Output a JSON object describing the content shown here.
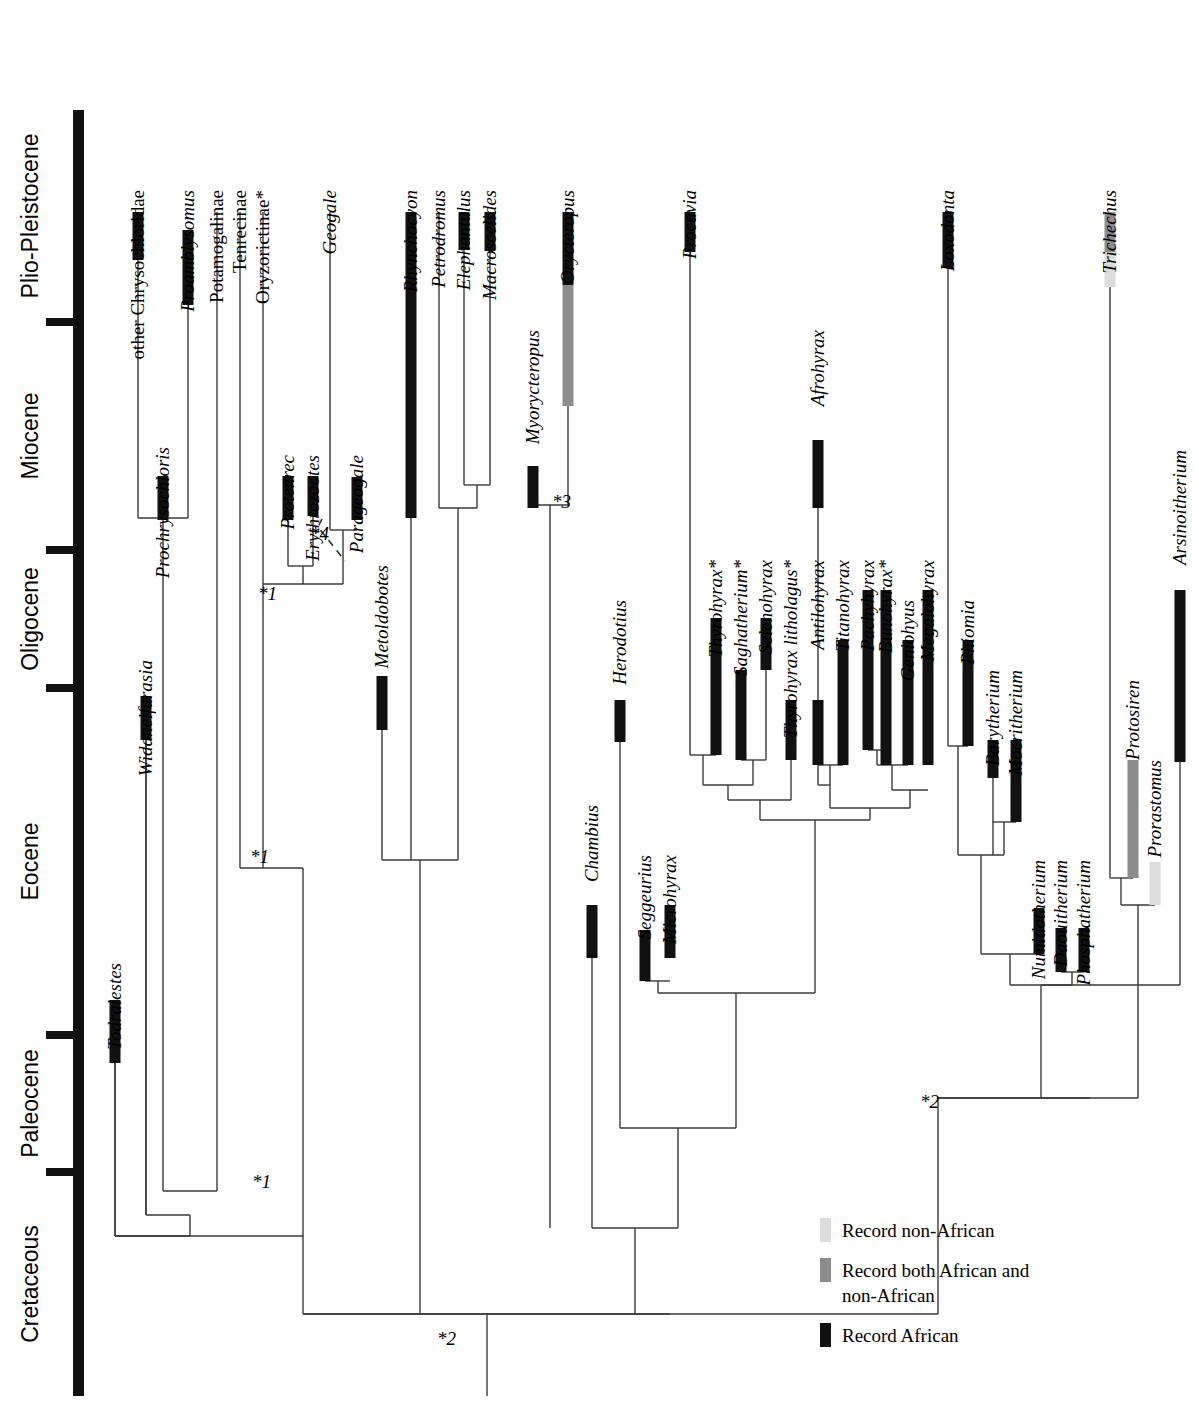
{
  "figure": {
    "type": "phylogenetic-time-tree",
    "orientation": "vertical-time-left",
    "colors": {
      "record_african": "#111111",
      "record_both": "#8c8c8c",
      "record_non_african": "#dcdcdc",
      "branch": "#3a3a3a",
      "axis": "#111111",
      "background": "#ffffff"
    }
  },
  "timescale": {
    "axis_name": "geologic-epochs",
    "epochs": [
      {
        "label": "Plio-Pleistocene",
        "y_top": 110,
        "y_bottom": 322
      },
      {
        "label": "Miocene",
        "y_top": 322,
        "y_bottom": 550
      },
      {
        "label": "Oligocene",
        "y_top": 550,
        "y_bottom": 688
      },
      {
        "label": "Eocene",
        "y_top": 688,
        "y_bottom": 1035
      },
      {
        "label": "Paleocene",
        "y_top": 1035,
        "y_bottom": 1172
      },
      {
        "label": "Cretaceous",
        "y_top": 1172,
        "y_bottom": 1396
      }
    ]
  },
  "taxa": [
    {
      "name": "Todralestes",
      "italic": true,
      "x": 115,
      "label_y": 963,
      "bar_top": 1000,
      "bar_bottom": 1063,
      "record": "african",
      "line_bottom": 1236
    },
    {
      "name": "other Chrysochloridae",
      "italic": false,
      "x": 138,
      "label_y": 190,
      "bar_top": 212,
      "bar_bottom": 260,
      "record": "african",
      "line_bottom": 518
    },
    {
      "name": "Prochrysochloris",
      "italic": true,
      "x": 163,
      "label_y": 447,
      "bar_top": 476,
      "bar_bottom": 520,
      "record": "african",
      "line_bottom": 520
    },
    {
      "name": "Proamblysomus",
      "italic": true,
      "x": 188,
      "label_y": 190,
      "bar_top": 230,
      "bar_bottom": 305,
      "record": "african",
      "line_bottom": 518
    },
    {
      "name": "Widanelfarasia",
      "italic": true,
      "x": 146,
      "label_y": 660,
      "bar_top": 696,
      "bar_bottom": 740,
      "record": "african",
      "line_bottom": 1215
    },
    {
      "name": "Potamogalinae",
      "italic": false,
      "x": 217,
      "label_y": 190,
      "bar_top": null,
      "bar_bottom": null,
      "record": "none",
      "line_bottom": 1191
    },
    {
      "name": "Tenrecinae",
      "italic": false,
      "x": 240,
      "label_y": 190,
      "bar_top": null,
      "bar_bottom": null,
      "record": "none",
      "line_bottom": 868
    },
    {
      "name": "Oryzorictinae*",
      "italic": false,
      "x": 263,
      "label_y": 190,
      "bar_top": null,
      "bar_bottom": null,
      "record": "none",
      "line_bottom": 584
    },
    {
      "name": "Protenrec",
      "italic": true,
      "x": 288,
      "label_y": 455,
      "bar_top": 476,
      "bar_bottom": 520,
      "record": "african",
      "line_bottom": 566
    },
    {
      "name": "Erythrozootes",
      "italic": true,
      "x": 313,
      "label_y": 455,
      "bar_top": 476,
      "bar_bottom": 516,
      "record": "african",
      "line_bottom": 566
    },
    {
      "name": "Geogale",
      "italic": true,
      "x": 330,
      "label_y": 190,
      "bar_top": null,
      "bar_bottom": null,
      "record": "none",
      "line_bottom": 530
    },
    {
      "name": "Parageogale",
      "italic": true,
      "x": 357,
      "label_y": 455,
      "bar_top": 477,
      "bar_bottom": 520,
      "record": "african",
      "line_bottom": 520
    },
    {
      "name": "Metoldobotes",
      "italic": true,
      "x": 382,
      "label_y": 565,
      "bar_top": 676,
      "bar_bottom": 730,
      "record": "african",
      "line_bottom": 860
    },
    {
      "name": "Rhynchocyon",
      "italic": true,
      "x": 411,
      "label_y": 190,
      "bar_top": 212,
      "bar_bottom": 518,
      "record": "african",
      "line_bottom": 860
    },
    {
      "name": "Petrodromus",
      "italic": true,
      "x": 439,
      "label_y": 190,
      "bar_top": null,
      "bar_bottom": null,
      "record": "none",
      "line_bottom": 508
    },
    {
      "name": "Elephantulus",
      "italic": true,
      "x": 464,
      "label_y": 190,
      "bar_top": 212,
      "bar_bottom": 250,
      "record": "african",
      "line_bottom": 485
    },
    {
      "name": "Macroscelides",
      "italic": true,
      "x": 490,
      "label_y": 190,
      "bar_top": 212,
      "bar_bottom": 251,
      "record": "african",
      "line_bottom": 485
    },
    {
      "name": "Myorycteropus",
      "italic": true,
      "x": 533,
      "label_y": 330,
      "bar_top": 466,
      "bar_bottom": 508,
      "record": "african",
      "line_bottom": 508
    },
    {
      "name": "Orycteropus",
      "italic": true,
      "x": 568,
      "label_y": 190,
      "bar_top": 212,
      "bar_bottom": 406,
      "record": "split",
      "split_y": 285,
      "line_bottom": 505
    },
    {
      "name": "Chambius",
      "italic": true,
      "x": 592,
      "label_y": 805,
      "bar_top": 905,
      "bar_bottom": 958,
      "record": "african",
      "line_bottom": 1228
    },
    {
      "name": "Herodotius",
      "italic": true,
      "x": 620,
      "label_y": 600,
      "bar_top": 700,
      "bar_bottom": 742,
      "record": "african",
      "line_bottom": 1128
    },
    {
      "name": "Seggeurius",
      "italic": true,
      "x": 645,
      "label_y": 855,
      "bar_top": 930,
      "bar_bottom": 981,
      "record": "african",
      "line_bottom": 981
    },
    {
      "name": "Microhyrax",
      "italic": true,
      "x": 670,
      "label_y": 855,
      "bar_top": 905,
      "bar_bottom": 958,
      "record": "african",
      "line_bottom": 958
    },
    {
      "name": "Procavia",
      "italic": true,
      "x": 690,
      "label_y": 190,
      "bar_top": 212,
      "bar_bottom": 252,
      "record": "african",
      "line_bottom": 755
    },
    {
      "name": "Thyrohyrax*",
      "italic": true,
      "x": 716,
      "label_y": 560,
      "bar_top": 618,
      "bar_bottom": 755,
      "record": "african",
      "line_bottom": 755
    },
    {
      "name": "Saghatherium*",
      "italic": true,
      "x": 741,
      "label_y": 560,
      "bar_top": 670,
      "bar_bottom": 760,
      "record": "african",
      "line_bottom": 760
    },
    {
      "name": "Selenohyrax",
      "italic": true,
      "x": 766,
      "label_y": 560,
      "bar_top": 618,
      "bar_bottom": 670,
      "record": "african",
      "line_bottom": 760
    },
    {
      "name": "Thyrohyrax litholagus*",
      "italic": true,
      "x": 791,
      "label_y": 560,
      "bar_top": 700,
      "bar_bottom": 760,
      "record": "african",
      "line_bottom": 800
    },
    {
      "name": "Antilohyrax",
      "italic": true,
      "x": 818,
      "label_y": 560,
      "bar_top": 700,
      "bar_bottom": 765,
      "record": "african",
      "line_bottom": 765
    },
    {
      "name": "Afrohyrax",
      "italic": true,
      "x": 818,
      "label_y": 330,
      "bar_top": 440,
      "bar_bottom": 508,
      "record": "african",
      "line_bottom": 785
    },
    {
      "name": "Titanohyrax",
      "italic": true,
      "x": 843,
      "label_y": 560,
      "bar_top": 640,
      "bar_bottom": 765,
      "record": "african",
      "line_bottom": 765
    },
    {
      "name": "Pachyhyrax",
      "italic": true,
      "x": 868,
      "label_y": 560,
      "bar_top": 590,
      "bar_bottom": 750,
      "record": "african",
      "line_bottom": 750
    },
    {
      "name": "Bunohyrax*",
      "italic": true,
      "x": 886,
      "label_y": 560,
      "bar_top": 590,
      "bar_bottom": 765,
      "record": "african",
      "line_bottom": 765
    },
    {
      "name": "Geniohyus",
      "italic": true,
      "x": 908,
      "label_y": 600,
      "bar_top": 640,
      "bar_bottom": 765,
      "record": "african",
      "line_bottom": 765
    },
    {
      "name": "Megalohyrax",
      "italic": true,
      "x": 928,
      "label_y": 560,
      "bar_top": 590,
      "bar_bottom": 765,
      "record": "african",
      "line_bottom": 765
    },
    {
      "name": "Loxodonta",
      "italic": true,
      "x": 948,
      "label_y": 190,
      "bar_top": 212,
      "bar_bottom": 268,
      "record": "african",
      "line_bottom": 746
    },
    {
      "name": "Phiomia",
      "italic": true,
      "x": 968,
      "label_y": 600,
      "bar_top": 640,
      "bar_bottom": 746,
      "record": "african",
      "line_bottom": 746
    },
    {
      "name": "Barytherium",
      "italic": true,
      "x": 993,
      "label_y": 670,
      "bar_top": 740,
      "bar_bottom": 778,
      "record": "african",
      "line_bottom": 855
    },
    {
      "name": "Moeritherium",
      "italic": true,
      "x": 1016,
      "label_y": 670,
      "bar_top": 740,
      "bar_bottom": 822,
      "record": "african",
      "line_bottom": 822
    },
    {
      "name": "Numidotherium",
      "italic": true,
      "x": 1039,
      "label_y": 860,
      "bar_top": 908,
      "bar_bottom": 954,
      "record": "african",
      "line_bottom": 954
    },
    {
      "name": "Daouitherium",
      "italic": true,
      "x": 1061,
      "label_y": 860,
      "bar_top": 928,
      "bar_bottom": 972,
      "record": "african",
      "line_bottom": 972
    },
    {
      "name": "Phosphatherium",
      "italic": true,
      "x": 1084,
      "label_y": 860,
      "bar_top": 928,
      "bar_bottom": 972,
      "record": "african",
      "line_bottom": 972
    },
    {
      "name": "Trichechus",
      "italic": true,
      "x": 1110,
      "label_y": 190,
      "bar_top": 212,
      "bar_bottom": 287,
      "record": "split-non",
      "split_y": 252,
      "line_bottom": 878
    },
    {
      "name": "Protosiren",
      "italic": true,
      "x": 1133,
      "label_y": 680,
      "bar_top": 760,
      "bar_bottom": 878,
      "record": "both",
      "line_bottom": 878
    },
    {
      "name": "Prorastomus",
      "italic": true,
      "x": 1155,
      "label_y": 760,
      "bar_top": 862,
      "bar_bottom": 905,
      "record": "non-african",
      "line_bottom": 905
    },
    {
      "name": "Arsinoitherium",
      "italic": true,
      "x": 1180,
      "label_y": 450,
      "bar_top": 590,
      "bar_bottom": 762,
      "record": "african",
      "line_bottom": 985
    }
  ],
  "nodes": [
    {
      "name": "chrysochlorid-node",
      "y": 518,
      "x_left": 138,
      "x_right": 188
    },
    {
      "name": "golden-mole-stem",
      "y": 1191,
      "x_left": 163,
      "x_right": 217
    },
    {
      "name": "tenrecid-crown",
      "y": 566,
      "x_left": 288,
      "x_right": 313
    },
    {
      "name": "geogale-node",
      "y": 530,
      "x_left": 330,
      "x_right": 357
    },
    {
      "name": "tenrec-node-1",
      "y": 584,
      "x_left": 263,
      "x_right": 343
    },
    {
      "name": "tenrec-node-2",
      "y": 868,
      "x_left": 240,
      "x_right": 303
    },
    {
      "name": "macroscelid-crown",
      "y": 485,
      "x_left": 464,
      "x_right": 490
    },
    {
      "name": "macroscelid-node",
      "y": 508,
      "x_left": 439,
      "x_right": 477
    },
    {
      "name": "elephant-shrew-node",
      "y": 860,
      "x_left": 382,
      "x_right": 458
    },
    {
      "name": "tubulidentate-node",
      "y": 505,
      "x_left": 533,
      "x_right": 568
    },
    {
      "name": "hyrax-node-1",
      "y": 755,
      "x_left": 690,
      "x_right": 716
    },
    {
      "name": "hyrax-node-2",
      "y": 760,
      "x_left": 741,
      "x_right": 766
    },
    {
      "name": "hyrax-node-3",
      "y": 785,
      "x_left": 703,
      "x_right": 753
    },
    {
      "name": "hyrax-node-4",
      "y": 800,
      "x_left": 728,
      "x_right": 791
    },
    {
      "name": "hyrax-node-5",
      "y": 765,
      "x_left": 818,
      "x_right": 843
    },
    {
      "name": "hyrax-node-6",
      "y": 785,
      "x_left": 818,
      "x_right": 830
    },
    {
      "name": "hyrax-node-7",
      "y": 750,
      "x_left": 868,
      "x_right": 886
    },
    {
      "name": "hyrax-node-8",
      "y": 765,
      "x_left": 877,
      "x_right": 908
    },
    {
      "name": "hyrax-node-9",
      "y": 790,
      "x_left": 892,
      "x_right": 928
    },
    {
      "name": "hyrax-node-10",
      "y": 808,
      "x_left": 830,
      "x_right": 910
    },
    {
      "name": "hyrax-node-11",
      "y": 820,
      "x_left": 760,
      "x_right": 870
    },
    {
      "name": "seggeurius-node",
      "y": 981,
      "x_left": 645,
      "x_right": 670
    },
    {
      "name": "hyracoid-stem",
      "y": 993,
      "x_left": 658,
      "x_right": 815
    },
    {
      "name": "paenungulate-node",
      "y": 1128,
      "x_left": 620,
      "x_right": 736
    },
    {
      "name": "chambius-node",
      "y": 1228,
      "x_left": 592,
      "x_right": 678
    },
    {
      "name": "proboscid-node-1",
      "y": 746,
      "x_left": 948,
      "x_right": 968
    },
    {
      "name": "proboscid-node-2",
      "y": 822,
      "x_left": 993,
      "x_right": 1016
    },
    {
      "name": "proboscid-node-3",
      "y": 855,
      "x_left": 958,
      "x_right": 1004
    },
    {
      "name": "proboscid-node-4",
      "y": 954,
      "x_left": 981,
      "x_right": 1039
    },
    {
      "name": "proboscid-node-5",
      "y": 972,
      "x_left": 1061,
      "x_right": 1084
    },
    {
      "name": "proboscid-node-6",
      "y": 985,
      "x_left": 1010,
      "x_right": 1072
    },
    {
      "name": "sirenian-node-1",
      "y": 878,
      "x_left": 1110,
      "x_right": 1133
    },
    {
      "name": "sirenian-node-2",
      "y": 905,
      "x_left": 1121,
      "x_right": 1155
    },
    {
      "name": "tethytheria-node",
      "y": 1098,
      "x_left": 1041,
      "x_right": 1138
    },
    {
      "name": "afrotheria-node",
      "y": 1098,
      "x_left": 938,
      "x_right": 1090
    },
    {
      "name": "deep-node-2",
      "y": 1314,
      "x_left": 303,
      "x_right": 670
    },
    {
      "name": "deep-node-1",
      "y": 1236,
      "x_left": 115,
      "x_right": 190
    },
    {
      "name": "root-stem",
      "y": 1396,
      "x": 487
    }
  ],
  "footnotes": [
    {
      "label": "*1",
      "x": 258,
      "y": 600
    },
    {
      "label": "*4",
      "x": 310,
      "y": 540
    },
    {
      "label": "*1",
      "x": 250,
      "y": 863
    },
    {
      "label": "*1",
      "x": 252,
      "y": 1188
    },
    {
      "label": "*3",
      "x": 552,
      "y": 508
    },
    {
      "label": "*2",
      "x": 920,
      "y": 1108
    },
    {
      "label": "*2",
      "x": 437,
      "y": 1345
    }
  ],
  "legend": {
    "name": "record-legend",
    "x": 820,
    "y": 1232,
    "items": [
      {
        "label": "Record non-African",
        "color": "#dcdcdc",
        "swatch": "non-african"
      },
      {
        "label": "Record both African and\nnon-African",
        "color": "#8c8c8c",
        "swatch": "both"
      },
      {
        "label": "Record African",
        "color": "#111111",
        "swatch": "african"
      }
    ]
  }
}
